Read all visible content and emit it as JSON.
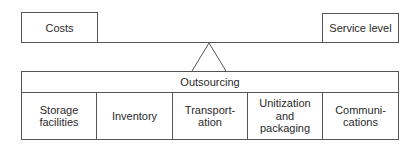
{
  "diagram": {
    "type": "balance-lever",
    "left_weight": {
      "label": "Costs"
    },
    "right_weight": {
      "label": "Service level"
    },
    "fulcrum": {
      "shape": "triangle"
    },
    "base": {
      "header": "Outsourcing",
      "cells": [
        {
          "label": "Storage\nfacilities"
        },
        {
          "label": "Inventory"
        },
        {
          "label": "Transport-\nation"
        },
        {
          "label": "Unitization\nand\npackaging"
        },
        {
          "label": "Communi-\ncations"
        }
      ]
    },
    "colors": {
      "line": "#555555",
      "text": "#2a2a2a",
      "background": "#ffffff"
    }
  }
}
